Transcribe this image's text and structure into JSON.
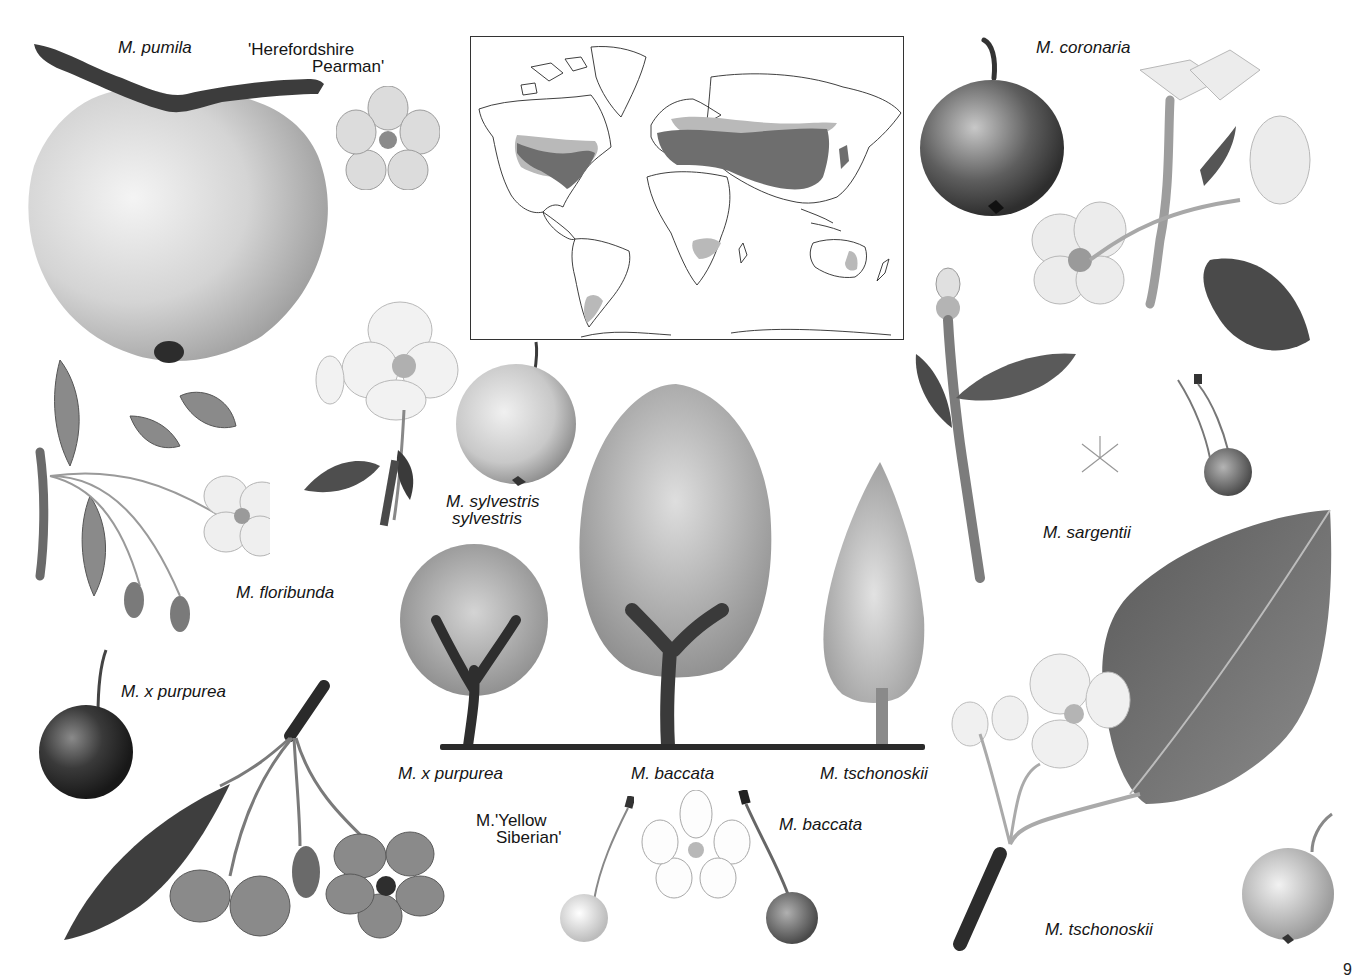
{
  "page": {
    "number": "9",
    "colors": {
      "ink": "#151515",
      "shade_dark": "#3a3a3a",
      "shade_mid": "#8a8a8a",
      "shade_light": "#d6d6d6",
      "map_native": "#6e6e6e",
      "map_introduced": "#b9b9b9"
    }
  },
  "labels": {
    "pumila": "M. pumila",
    "herefordshire_line1": "'Herefordshire",
    "herefordshire_line2": "Pearman'",
    "coronaria": "M. coronaria",
    "floribunda": "M. floribunda",
    "sylvestris_line1": "M. sylvestris",
    "sylvestris_line2": "sylvestris",
    "sargentii": "M. sargentii",
    "purpurea_fruit": "M. x purpurea",
    "tree_purpurea": "M. x purpurea",
    "tree_baccata": "M. baccata",
    "tree_tschonoskii": "M. tschonoskii",
    "yellow_siberian_line1": "M.'Yellow",
    "yellow_siberian_line2": "Siberian'",
    "baccata_fruit": "M. baccata",
    "tschonoskii_fruit": "M. tschonoskii"
  },
  "map": {
    "type": "world distribution map",
    "regions_native": [
      "North America (eastern & central USA, southern Canada)",
      "Europe",
      "Central & East Asia",
      "Japan"
    ],
    "regions_introduced": [
      "Pacific Northwest / western USA",
      "Scandinavia / northern Russia fringe",
      "South Africa",
      "Patagonia",
      "SE Australia"
    ]
  },
  "trees": [
    {
      "name": "M. x purpurea",
      "shape": "rounded"
    },
    {
      "name": "M. baccata",
      "shape": "tall-oval"
    },
    {
      "name": "M. tschonoskii",
      "shape": "conical"
    }
  ]
}
